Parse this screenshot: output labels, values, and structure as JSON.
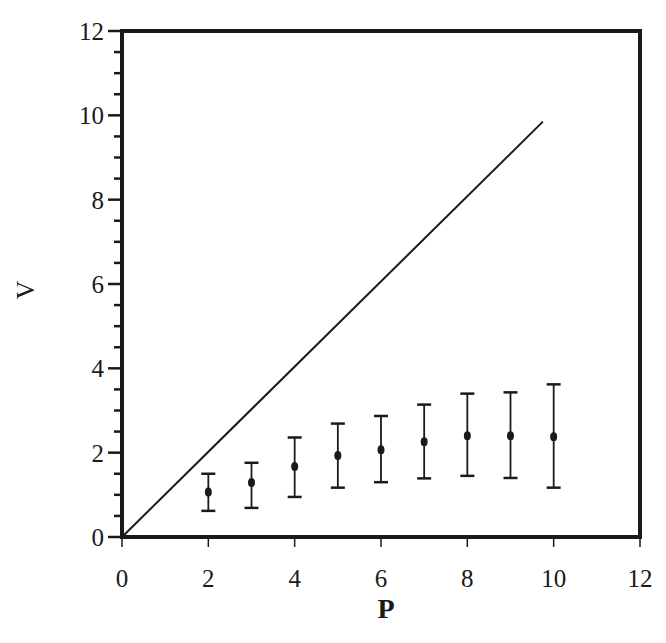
{
  "chart_data": {
    "type": "scatter",
    "title": "",
    "xlabel": "P",
    "ylabel": "V",
    "xlim": [
      0,
      12
    ],
    "ylim": [
      0,
      12
    ],
    "grid": false,
    "legend": null,
    "x_ticks": [
      0,
      2,
      4,
      6,
      8,
      10,
      12
    ],
    "y_ticks": [
      0,
      2,
      4,
      6,
      8,
      10,
      12
    ],
    "y_minor_tick_step": 0.5,
    "series": [
      {
        "name": "reference line V = P",
        "kind": "line",
        "x": [
          0,
          9.75
        ],
        "y": [
          0,
          9.85
        ]
      },
      {
        "name": "measured V (mean with error bars)",
        "kind": "errorbar",
        "x": [
          2,
          3,
          4,
          5,
          6,
          7,
          8,
          9,
          10
        ],
        "y": [
          1.07,
          1.29,
          1.67,
          1.93,
          2.07,
          2.26,
          2.4,
          2.4,
          2.38
        ],
        "y_lower": [
          0.62,
          0.69,
          0.95,
          1.17,
          1.3,
          1.39,
          1.45,
          1.4,
          1.17
        ],
        "y_upper": [
          1.5,
          1.76,
          2.36,
          2.69,
          2.87,
          3.14,
          3.4,
          3.43,
          3.62
        ]
      }
    ]
  },
  "colors": {
    "ink": "#1a1a1a",
    "background": "#ffffff"
  }
}
